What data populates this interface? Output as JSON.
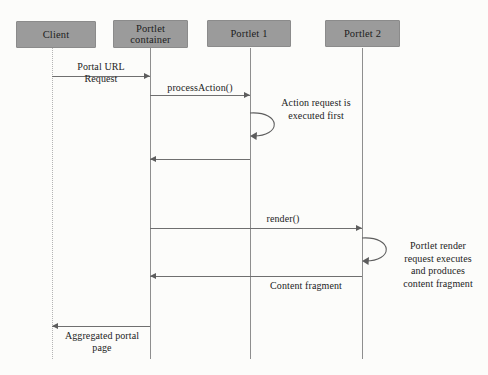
{
  "diagram": {
    "type": "uml-sequence-diagram",
    "background_color": "#fcfcfa",
    "participant_fill": "#9b9b9b",
    "line_color": "#6f6f6f",
    "participants": [
      {
        "id": "client",
        "label": "Client",
        "x": 16,
        "y": 21,
        "width": 80,
        "height": 27,
        "lifeline_x": 52,
        "lifeline_style": "dotted"
      },
      {
        "id": "portlet-container",
        "label": "Portlet\ncontainer",
        "x": 113,
        "y": 20,
        "width": 75,
        "height": 28,
        "lifeline_x": 150,
        "lifeline_style": "solid"
      },
      {
        "id": "portlet-1",
        "label": "Portlet 1",
        "x": 207,
        "y": 20,
        "width": 84,
        "height": 27,
        "lifeline_x": 250,
        "lifeline_style": "solid"
      },
      {
        "id": "portlet-2",
        "label": "Portlet 2",
        "x": 325,
        "y": 20,
        "width": 75,
        "height": 27,
        "lifeline_x": 362,
        "lifeline_style": "solid"
      }
    ],
    "messages": [
      {
        "id": "portal-url-request",
        "label": "Portal URL\nRequest",
        "from": "client",
        "to": "portlet-container",
        "direction": "right",
        "y": 76,
        "label_x": 60,
        "label_y": 61,
        "label_width": 82
      },
      {
        "id": "process-action",
        "label": "processAction()",
        "from": "portlet-container",
        "to": "portlet-1",
        "direction": "right",
        "y": 95,
        "label_x": 152,
        "label_y": 82,
        "label_width": 96
      },
      {
        "id": "action-return",
        "label": "",
        "from": "portlet-1",
        "to": "portlet-container",
        "direction": "left",
        "y": 159,
        "label_x": 0,
        "label_y": 0,
        "label_width": 0
      },
      {
        "id": "render",
        "label": "render()",
        "from": "portlet-container",
        "to": "portlet-2",
        "direction": "right",
        "y": 228,
        "label_x": 250,
        "label_y": 213,
        "label_width": 66
      },
      {
        "id": "content-fragment",
        "label": "Content fragment",
        "from": "portlet-2",
        "to": "portlet-container",
        "direction": "left",
        "y": 276,
        "label_x": 250,
        "label_y": 280,
        "label_width": 112
      },
      {
        "id": "aggregated-portal-page",
        "label": "Aggregated portal\npage",
        "from": "portlet-container",
        "to": "client",
        "direction": "left",
        "y": 326,
        "label_x": 54,
        "label_y": 330,
        "label_width": 96
      }
    ],
    "self_calls": [
      {
        "id": "action-executed-first",
        "on": "portlet-1",
        "note": "Action request is\nexecuted first",
        "loop_x": 250,
        "loop_y": 111,
        "loop_width": 28,
        "loop_height": 26,
        "note_x": 262,
        "note_y": 97,
        "note_width": 108
      },
      {
        "id": "portlet-render-executes",
        "on": "portlet-2",
        "note": "Portlet render\nrequest executes\nand produces\ncontent fragment",
        "loop_x": 362,
        "loop_y": 236,
        "loop_width": 28,
        "loop_height": 26,
        "note_x": 392,
        "note_y": 240,
        "note_width": 92
      }
    ],
    "lifeline_top": 48,
    "lifeline_bottom": 359
  }
}
